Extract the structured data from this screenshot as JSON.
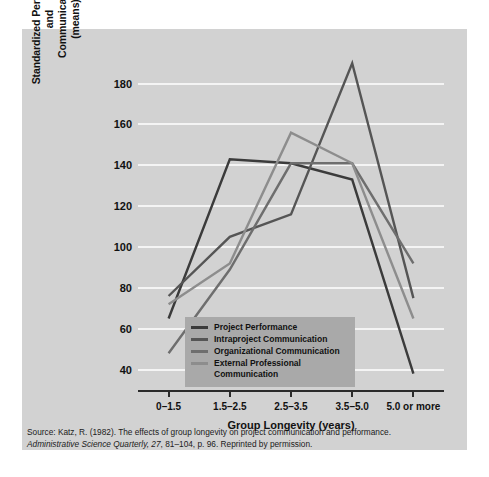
{
  "chart_data": {
    "type": "line",
    "title": "",
    "xlabel": "Group Longevity (years)",
    "ylabel": "Standardized Performance and Communication (means)",
    "ylabel_lines": [
      "Standardized Performance",
      "and",
      "Communication",
      "(means)"
    ],
    "categories": [
      "0–1.5",
      "1.5–2.5",
      "2.5–3.5",
      "3.5–5.0",
      "5.0 or more"
    ],
    "yticks": [
      40,
      60,
      80,
      100,
      120,
      140,
      160,
      180
    ],
    "ylim": [
      30,
      195
    ],
    "grid": "horizontal-white",
    "legend_position": "inside-bottom-center",
    "series": [
      {
        "name": "Project Performance",
        "color": "#3b3b3b",
        "values": [
          65,
          143,
          141,
          133,
          38
        ]
      },
      {
        "name": "Intraproject Communication",
        "color": "#555555",
        "values": [
          76,
          105,
          116,
          190,
          75
        ]
      },
      {
        "name": "Organizational Communication",
        "color": "#6e6e6e",
        "values": [
          48,
          89,
          141,
          141,
          92
        ]
      },
      {
        "name": "External Professional Communication",
        "color": "#8d8d8d",
        "values": [
          72,
          92,
          156,
          141,
          65
        ]
      }
    ]
  },
  "legend": {
    "items": [
      {
        "label": "Project Performance"
      },
      {
        "label": "Intraproject Communication"
      },
      {
        "label": "Organizational Communication"
      },
      {
        "label": "External Professional Communication"
      }
    ]
  },
  "caption": {
    "line1": "Source: Katz, R. (1982). The effects of group longevity on project communication and performance.",
    "journal": "Administrative Science Quarterly, 27",
    "line2_rest": ", 81–104, p. 96. Reprinted by permission."
  },
  "colors": {
    "figure_background": "#d2d2d2",
    "gridline": "#f4f4f4",
    "axis": "#2b2b2b",
    "legend_background": "#a9a9a9"
  }
}
